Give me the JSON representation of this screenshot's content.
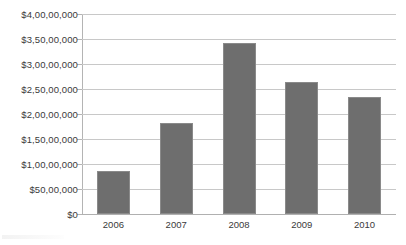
{
  "chart_data": {
    "type": "bar",
    "title": "",
    "subtitle": "",
    "xlabel": "",
    "ylabel": "",
    "categories": [
      "2006",
      "2007",
      "2008",
      "2009",
      "2010"
    ],
    "values": [
      8700000,
      18200000,
      34300000,
      26500000,
      23500000
    ],
    "value_labels": [
      "$87,00,000",
      "$1,82,00,000",
      "$3,43,00,000",
      "$2,65,00,000",
      "$2,35,00,000"
    ],
    "ylim": [
      0,
      40000000
    ],
    "ytick_values": [
      0,
      5000000,
      10000000,
      15000000,
      20000000,
      25000000,
      30000000,
      35000000,
      40000000
    ],
    "ytick_labels": [
      "$0",
      "$50,00,000",
      "$1,00,00,000",
      "$1,50,00,000",
      "$2,00,00,000",
      "$2,50,00,000",
      "$3,00,00,000",
      "$3,50,00,000",
      "$4,00,00,000"
    ],
    "grid": true,
    "grid_axis": "y",
    "legend": false,
    "legend_position": "none",
    "series": [
      {
        "name": "",
        "values": [
          8700000,
          18200000,
          34300000,
          26500000,
          23500000
        ]
      }
    ],
    "colors": {
      "bar_fill": "#6E6E6E",
      "bar_border": "#8A8A8A",
      "gridline": "#C8C8C8",
      "axis_line": "#B4B4B4",
      "text": "#3A3A3A",
      "background": "#FFFFFF"
    }
  }
}
